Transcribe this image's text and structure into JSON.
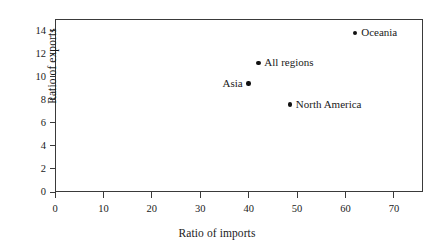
{
  "chart_data": {
    "type": "scatter",
    "title": "",
    "xlabel": "Ratio of imports",
    "ylabel": "Ratio of exports",
    "xlim": [
      0,
      76
    ],
    "ylim": [
      0,
      15
    ],
    "xticks": [
      0,
      10,
      20,
      30,
      40,
      50,
      60,
      70
    ],
    "xtick_labels": [
      "0",
      "10",
      "20",
      "30",
      "40",
      "50",
      "60",
      "70"
    ],
    "yticks": [
      0,
      2,
      4,
      6,
      8,
      10,
      12,
      14
    ],
    "ytick_labels": [
      "0",
      "2",
      "4",
      "6",
      "8",
      "10",
      "12",
      "14"
    ],
    "grid": false,
    "legend": "none",
    "marker_color": "#111111",
    "frame_color": "#3a3a3a",
    "points": [
      {
        "label": "Oceania",
        "x": 62.0,
        "y": 13.8,
        "label_side": "right"
      },
      {
        "label": "All regions",
        "x": 42.0,
        "y": 11.2,
        "label_side": "right"
      },
      {
        "label": "Asia",
        "x": 40.0,
        "y": 9.4,
        "label_side": "left"
      },
      {
        "label": "North America",
        "x": 48.5,
        "y": 7.6,
        "label_side": "right"
      }
    ]
  }
}
